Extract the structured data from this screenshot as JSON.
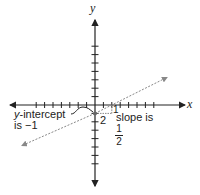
{
  "diagram": {
    "axes": {
      "x_label": "x",
      "y_label": "y",
      "origin_px": [
        95,
        105
      ],
      "tick_spacing_px": 8.4,
      "x_ticks_each_side": 7,
      "y_ticks_each_side": 7
    },
    "line": {
      "equation": "y = (1/2)x - 1",
      "slope_num": "1",
      "slope_den": "2",
      "y_intercept": -1,
      "style": "dashed"
    },
    "annotations": {
      "intercept_line1": "y-intercept",
      "intercept_line1_italic_part": "y",
      "intercept_line1_rest": "-intercept",
      "intercept_line2": "is −1",
      "rise_label": "1",
      "run_label": "2",
      "slope_text": "slope is",
      "slope_frac_num": "1",
      "slope_frac_den": "2"
    },
    "colors": {
      "axis": "#222222",
      "line": "#888888"
    }
  }
}
